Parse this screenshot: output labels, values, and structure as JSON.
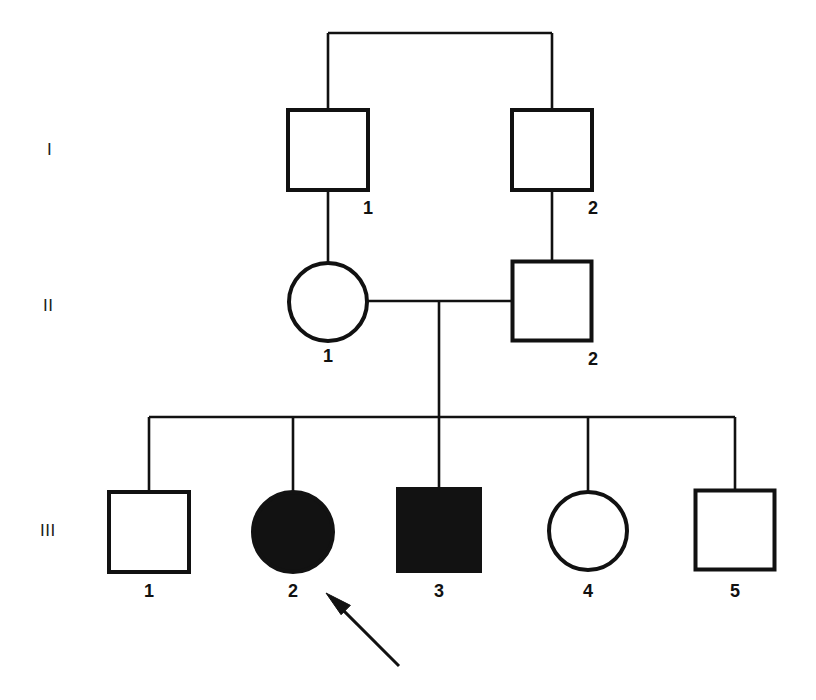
{
  "figure": {
    "kind": "pedigree-chart",
    "background_color": "#ffffff",
    "line_color": "#111111",
    "filled_color": "#121212",
    "open_fill_color": "#ffffff",
    "width": 816,
    "height": 700
  },
  "generation_labels": [
    {
      "name": "generation-label-1",
      "text": "I",
      "x": 47,
      "y": 155
    },
    {
      "name": "generation-label-2",
      "text": "II",
      "x": 43,
      "y": 311
    },
    {
      "name": "generation-label-3",
      "text": "III",
      "x": 40,
      "y": 536
    }
  ],
  "individuals": [
    {
      "id": "I-1",
      "generation": "I",
      "label": "1",
      "sex": "male",
      "shape": "square",
      "affected": false,
      "cx": 328,
      "cy": 150,
      "size": 80,
      "label_x": 368,
      "label_y": 214
    },
    {
      "id": "I-2",
      "generation": "I",
      "label": "2",
      "sex": "male",
      "shape": "square",
      "affected": false,
      "cx": 552,
      "cy": 150,
      "size": 80,
      "label_x": 593,
      "label_y": 214
    },
    {
      "id": "II-1",
      "generation": "II",
      "label": "1",
      "sex": "female",
      "shape": "circle",
      "affected": false,
      "cx": 328,
      "cy": 302,
      "radius": 39,
      "label_x": 328,
      "label_y": 362
    },
    {
      "id": "II-2",
      "generation": "II",
      "label": "2",
      "sex": "male",
      "shape": "square",
      "affected": false,
      "cx": 552,
      "cy": 301,
      "size": 79,
      "label_x": 593,
      "label_y": 365
    },
    {
      "id": "III-1",
      "generation": "III",
      "label": "1",
      "sex": "male",
      "shape": "square",
      "affected": false,
      "cx": 149,
      "cy": 532,
      "size": 80,
      "label_x": 149,
      "label_y": 597
    },
    {
      "id": "III-2",
      "generation": "III",
      "label": "2",
      "sex": "female",
      "shape": "circle",
      "affected": true,
      "cx": 293,
      "cy": 532,
      "radius": 40,
      "label_x": 293,
      "label_y": 597
    },
    {
      "id": "III-3",
      "generation": "III",
      "label": "3",
      "sex": "male",
      "shape": "square",
      "affected": true,
      "cx": 439,
      "cy": 530,
      "size": 82,
      "label_x": 439,
      "label_y": 597
    },
    {
      "id": "III-4",
      "generation": "III",
      "label": "4",
      "sex": "female",
      "shape": "circle",
      "affected": false,
      "cx": 588,
      "cy": 531,
      "radius": 39,
      "label_x": 588,
      "label_y": 597
    },
    {
      "id": "III-5",
      "generation": "III",
      "label": "5",
      "sex": "male",
      "shape": "square",
      "affected": false,
      "cx": 735,
      "cy": 530,
      "size": 79,
      "label_x": 735,
      "label_y": 597
    }
  ],
  "connections": [
    {
      "name": "sibling-bar-generation-1",
      "type": "horizontal",
      "x1": 328,
      "x2": 552,
      "y": 33
    },
    {
      "name": "drop-line-to-I-1",
      "type": "vertical",
      "x": 328,
      "y1": 33,
      "y2": 110
    },
    {
      "name": "drop-line-to-I-2",
      "type": "vertical",
      "x": 552,
      "y1": 33,
      "y2": 110
    },
    {
      "name": "descent-line-I-1-to-II-1",
      "type": "vertical",
      "x": 328,
      "y1": 190,
      "y2": 263
    },
    {
      "name": "descent-line-I-2-to-II-2",
      "type": "vertical",
      "x": 552,
      "y1": 190,
      "y2": 262
    },
    {
      "name": "marriage-line-II-1-II-2",
      "type": "horizontal",
      "x1": 367,
      "x2": 513,
      "y": 301
    },
    {
      "name": "descent-line-to-sibship-III",
      "type": "vertical",
      "x": 439,
      "y1": 301,
      "y2": 417
    },
    {
      "name": "sibship-bar-generation-3",
      "type": "horizontal",
      "x1": 149,
      "x2": 735,
      "y": 417
    },
    {
      "name": "drop-line-to-III-1",
      "type": "vertical",
      "x": 149,
      "y1": 417,
      "y2": 492
    },
    {
      "name": "drop-line-to-III-2",
      "type": "vertical",
      "x": 293,
      "y1": 417,
      "y2": 493
    },
    {
      "name": "drop-line-to-III-3",
      "type": "vertical",
      "x": 439,
      "y1": 417,
      "y2": 489
    },
    {
      "name": "drop-line-to-III-4",
      "type": "vertical",
      "x": 588,
      "y1": 417,
      "y2": 492
    },
    {
      "name": "drop-line-to-III-5",
      "type": "vertical",
      "x": 735,
      "y1": 417,
      "y2": 491
    }
  ],
  "proband_arrow": {
    "name": "proband-arrow",
    "points_to": "III-2",
    "tail_x": 399,
    "tail_y": 666,
    "tip_x": 326,
    "tip_y": 593,
    "stroke_width": 3
  },
  "stroke_widths": {
    "symbol": 4,
    "connector": 2.6
  }
}
